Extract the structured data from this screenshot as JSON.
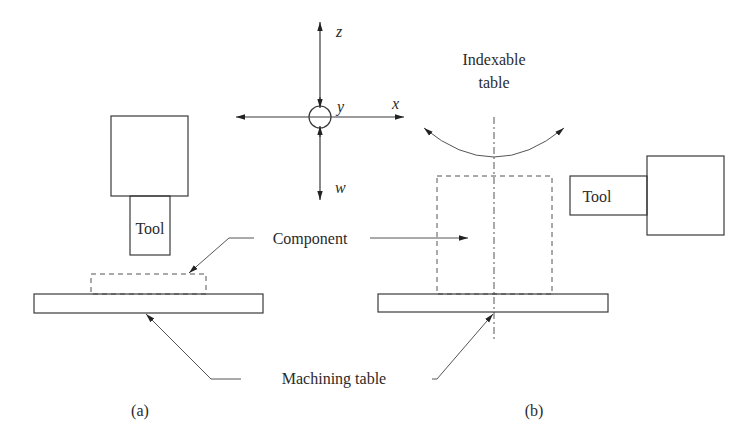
{
  "figure": {
    "axes": {
      "z_label": "z",
      "y_label": "y",
      "x_label": "x",
      "w_label": "w"
    },
    "panel_a": {
      "caption": "(a)",
      "tool_label": "Tool"
    },
    "panel_b": {
      "caption": "(b)",
      "tool_label": "Tool",
      "indexable_line1": "Indexable",
      "indexable_line2": "table"
    },
    "labels": {
      "component": "Component",
      "machining_table": "Machining table"
    },
    "colors": {
      "line": "#3a3a3a",
      "text": "#2a2a2a",
      "background": "#ffffff"
    }
  }
}
